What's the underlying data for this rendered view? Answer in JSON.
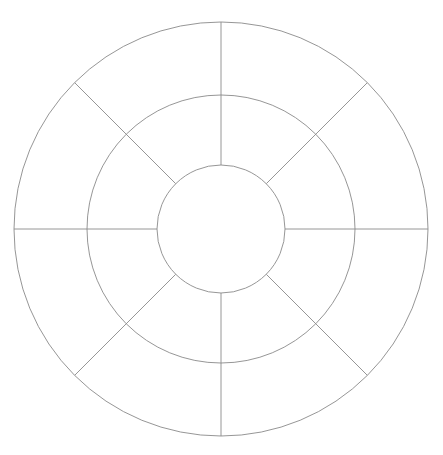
{
  "diagram": {
    "type": "concentric-ring-wheel",
    "title_fragment": "",
    "canvas": {
      "width": 443,
      "height": 455,
      "background": "#ffffff"
    },
    "center": {
      "x": 221,
      "y": 229
    },
    "rings": [
      {
        "name": "inner",
        "radius": 64
      },
      {
        "name": "middle",
        "radius": 134
      },
      {
        "name": "outer",
        "radius": 207
      }
    ],
    "spoke_angles_deg": [
      0,
      45,
      90,
      135,
      180,
      225,
      270,
      315
    ],
    "spoke_start_radius": 64,
    "spoke_end_radius": 207,
    "segments_per_ring": 8,
    "colors": {
      "line": "#8a8a8a"
    }
  }
}
